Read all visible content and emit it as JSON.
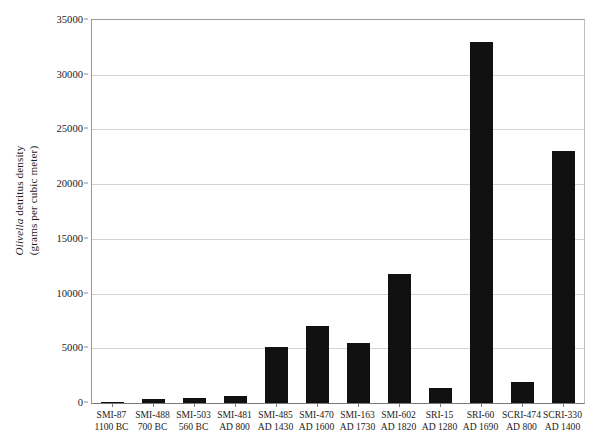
{
  "chart_data": {
    "type": "bar",
    "title": "",
    "subtitle": "",
    "xlabel": "",
    "ylabel_line1_genus": "Olivella",
    "ylabel_line1_rest": " detritus density",
    "ylabel_line2": "(grams per cubic meter)",
    "ylabel": "Olivella detritus density (grams per cubic meter)",
    "ylim": [
      0,
      35000
    ],
    "ytick_step": 5000,
    "ytick_labels": [
      "0",
      "5000",
      "10000",
      "15000",
      "20000",
      "25000",
      "30000",
      "35000"
    ],
    "ytick_values": [
      0,
      5000,
      10000,
      15000,
      20000,
      25000,
      30000,
      35000
    ],
    "grid": true,
    "legend": false,
    "bar_color": "#111111",
    "gridline_color": "#d4d4d4",
    "axis_color": "#9a9a9a",
    "categories": [
      "SMI-87 1100 BC",
      "SMI-488 700 BC",
      "SMI-503 560 BC",
      "SMI-481 AD 800",
      "SMI-485 AD 1430",
      "SMI-470 AD 1600",
      "SMI-163 AD 1730",
      "SMI-602 AD 1820",
      "SRI-15 AD 1280",
      "SRI-60 AD 1690",
      "SCRI-474 AD 800",
      "SCRI-330 AD 1400"
    ],
    "category_lines": [
      {
        "site": "SMI-87",
        "date": "1100 BC"
      },
      {
        "site": "SMI-488",
        "date": "700 BC"
      },
      {
        "site": "SMI-503",
        "date": "560 BC"
      },
      {
        "site": "SMI-481",
        "date": "AD 800"
      },
      {
        "site": "SMI-485",
        "date": "AD 1430"
      },
      {
        "site": "SMI-470",
        "date": "AD 1600"
      },
      {
        "site": "SMI-163",
        "date": "AD 1730"
      },
      {
        "site": "SMI-602",
        "date": "AD 1820"
      },
      {
        "site": "SRI-15",
        "date": "AD 1280"
      },
      {
        "site": "SRI-60",
        "date": "AD 1690"
      },
      {
        "site": "SCRI-474",
        "date": "AD 800"
      },
      {
        "site": "SCRI-330",
        "date": "AD 1400"
      }
    ],
    "values": [
      120,
      350,
      450,
      650,
      5100,
      7000,
      5500,
      11800,
      1400,
      33000,
      1950,
      23000
    ]
  }
}
